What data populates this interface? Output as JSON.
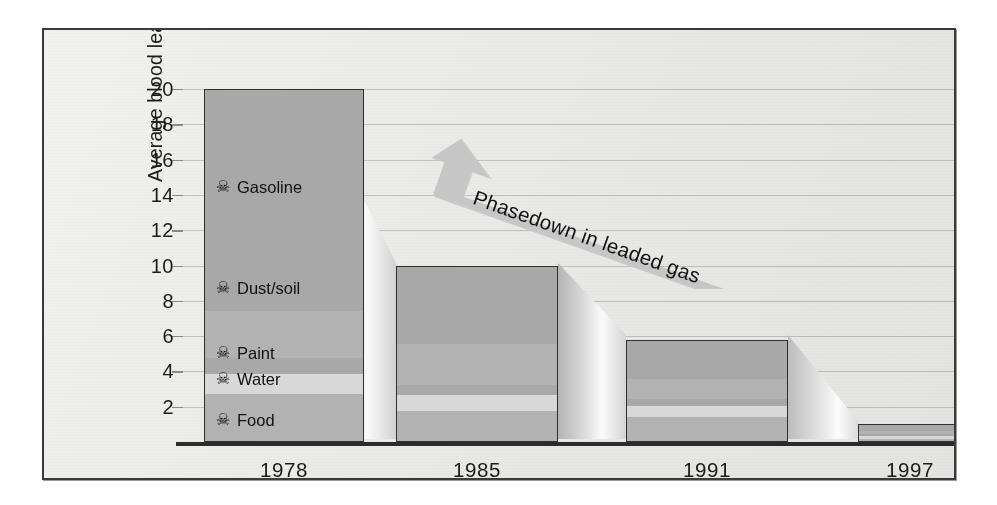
{
  "chart_data": {
    "type": "bar",
    "title": "",
    "xlabel": "",
    "ylabel": "Average blood lead (µg/dl)",
    "ylim": [
      0,
      20
    ],
    "yticks": [
      2,
      4,
      6,
      8,
      10,
      12,
      14,
      16,
      18,
      20
    ],
    "grid": true,
    "legend_position": "inside-first-bar",
    "categories": [
      "1978",
      "1985",
      "1991",
      "1997"
    ],
    "totals": [
      20.0,
      10.0,
      5.8,
      1.0
    ],
    "series": [
      {
        "name": "Gasoline",
        "values": [
          12.5,
          4.4,
          2.2,
          0.3
        ]
      },
      {
        "name": "Dust/soil",
        "values": [
          2.7,
          2.3,
          1.1,
          0.2
        ]
      },
      {
        "name": "Paint",
        "values": [
          0.9,
          0.6,
          0.4,
          0.1
        ]
      },
      {
        "name": "Water",
        "values": [
          1.1,
          0.9,
          0.6,
          0.15
        ]
      },
      {
        "name": "Food",
        "values": [
          2.8,
          1.8,
          1.5,
          0.25
        ]
      }
    ],
    "annotations": [
      {
        "text": "Phasedown in leaded gas",
        "kind": "double-headed-arrow"
      }
    ]
  },
  "axes": {
    "y_label": "Average blood lead (µg/dl)",
    "y_ticks": [
      "20",
      "18",
      "16",
      "14",
      "12",
      "10",
      "8",
      "6",
      "4",
      "2"
    ],
    "x_ticks": [
      "1978",
      "1985",
      "1991",
      "1997"
    ]
  },
  "legend": {
    "icon_name": "skull-and-crossbones-icon",
    "icon_glyph": "☠",
    "items": [
      {
        "label": "Gasoline"
      },
      {
        "label": "Dust/soil"
      },
      {
        "label": "Paint"
      },
      {
        "label": "Water"
      },
      {
        "label": "Food"
      }
    ]
  },
  "annotation": {
    "arrow_label": "Phasedown in leaded gas"
  },
  "colors": {
    "segment_dark": "#a8a8a8",
    "segment_mid": "#b2b2b2",
    "segment_light": "#d8d8d8",
    "bar_outline": "#2f2f2f",
    "grid": "#c9c9c9",
    "frame": "#3a3a3a",
    "paper": "#f5f5f4",
    "arrow_fill": "#c6c6c6",
    "text": "#1c1c1c"
  }
}
